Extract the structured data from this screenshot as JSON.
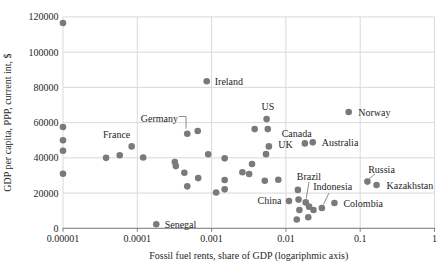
{
  "chart_data": {
    "type": "scatter",
    "title": "",
    "xlabel": "Fossil fuel rents, share of GDP (logariphmic axis)",
    "ylabel": "GDP per capita, PPP, current int, $",
    "x_scale": "log",
    "xlim": [
      1e-05,
      1
    ],
    "ylim": [
      0,
      120000
    ],
    "x_ticks": [
      1e-05,
      0.0001,
      0.001,
      0.01,
      0.1,
      1
    ],
    "x_tick_labels": [
      "0.00001",
      "0.0001",
      "0.001",
      "0.01",
      "0.1",
      "1"
    ],
    "y_ticks": [
      0,
      20000,
      40000,
      60000,
      80000,
      100000,
      120000
    ],
    "y_tick_labels": [
      "0",
      "20000",
      "40000",
      "60000",
      "80000",
      "100000",
      "120000"
    ],
    "grid": true,
    "legend": "none",
    "colors": {
      "marker": "#7a7a7a",
      "gridline": "#d9d9d9",
      "axis_line": "#808080",
      "leader_line": "#8c8c8c",
      "text": "#262626"
    },
    "points": [
      {
        "x": 1e-05,
        "y": 116500
      },
      {
        "x": 1e-05,
        "y": 57500
      },
      {
        "x": 1e-05,
        "y": 50000
      },
      {
        "x": 1e-05,
        "y": 44000
      },
      {
        "x": 1e-05,
        "y": 31000
      },
      {
        "x": 3.8e-05,
        "y": 40000
      },
      {
        "x": 5.8e-05,
        "y": 41500
      },
      {
        "x": 8.4e-05,
        "y": 46500,
        "label": "France",
        "dx": -15,
        "dy": -8.1,
        "anchor": "middle"
      },
      {
        "x": 0.00012,
        "y": 40200
      },
      {
        "x": 0.00018,
        "y": 2300,
        "label": "Senegal",
        "dx": 8.4,
        "dy": 3.8,
        "anchor": "start"
      },
      {
        "x": 0.00032,
        "y": 37600
      },
      {
        "x": 0.00033,
        "y": 35300
      },
      {
        "x": 0.00043,
        "y": 31500
      },
      {
        "x": 0.00047,
        "y": 53700,
        "label": "Germany",
        "dx": -9.2,
        "dy": -11.2,
        "anchor": "end",
        "leader": [
          [
            -8.2,
            -17.2
          ],
          [
            -1.2,
            -17.2
          ],
          [
            -1.2,
            -5.0
          ]
        ]
      },
      {
        "x": 0.00047,
        "y": 23800
      },
      {
        "x": 0.00065,
        "y": 55200
      },
      {
        "x": 0.00066,
        "y": 28500
      },
      {
        "x": 0.00086,
        "y": 83500,
        "label": "Ireland",
        "dx": 8,
        "dy": 3.5,
        "anchor": "start"
      },
      {
        "x": 0.0009,
        "y": 42000
      },
      {
        "x": 0.00115,
        "y": 20300
      },
      {
        "x": 0.0015,
        "y": 39700
      },
      {
        "x": 0.0015,
        "y": 27400
      },
      {
        "x": 0.0015,
        "y": 22100
      },
      {
        "x": 0.0026,
        "y": 31800
      },
      {
        "x": 0.0032,
        "y": 30800
      },
      {
        "x": 0.0035,
        "y": 36500
      },
      {
        "x": 0.0038,
        "y": 56300
      },
      {
        "x": 0.0055,
        "y": 62000,
        "label": "US",
        "dx": 1.4,
        "dy": -8.6,
        "anchor": "middle"
      },
      {
        "x": 0.0057,
        "y": 56300,
        "label": "Canada",
        "dx": 13.9,
        "dy": 7.9,
        "anchor": "start"
      },
      {
        "x": 0.0059,
        "y": 46500,
        "label": "UK",
        "dx": 9.4,
        "dy": 2.0,
        "anchor": "start"
      },
      {
        "x": 0.0054,
        "y": 42100
      },
      {
        "x": 0.0052,
        "y": 27000
      },
      {
        "x": 0.0079,
        "y": 27600
      },
      {
        "x": 0.011,
        "y": 15500,
        "label": "China",
        "dx": -7.5,
        "dy": 3.5,
        "anchor": "end"
      },
      {
        "x": 0.0145,
        "y": 21800
      },
      {
        "x": 0.0148,
        "y": 16300
      },
      {
        "x": 0.0152,
        "y": 10400
      },
      {
        "x": 0.014,
        "y": 5000
      },
      {
        "x": 0.0185,
        "y": 14700,
        "label": "Brazil",
        "dx": 3.2,
        "dy": -22.4,
        "anchor": "middle",
        "leader": [
          [
            3.2,
            -20.4
          ],
          [
            0.5,
            -4.0
          ]
        ]
      },
      {
        "x": 0.02,
        "y": 6300
      },
      {
        "x": 0.0205,
        "y": 12300
      },
      {
        "x": 0.023,
        "y": 48800,
        "label": "Australia",
        "dx": 8.9,
        "dy": 3.4,
        "anchor": "start"
      },
      {
        "x": 0.018,
        "y": 48200
      },
      {
        "x": 0.0235,
        "y": 10400
      },
      {
        "x": 0.0305,
        "y": 11500,
        "label": "Indonesia",
        "dx": -8.6,
        "dy": -18.0,
        "anchor": "start",
        "leader": [
          [
            7.1,
            -15.0
          ],
          [
            1.5,
            -3.5
          ]
        ]
      },
      {
        "x": 0.045,
        "y": 14400,
        "label": "Colombia",
        "dx": 9,
        "dy": 3.7,
        "anchor": "start"
      },
      {
        "x": 0.07,
        "y": 66000,
        "label": "Norway",
        "dx": 9.6,
        "dy": 3.8,
        "anchor": "start"
      },
      {
        "x": 0.125,
        "y": 26500,
        "label": "Russia",
        "dx": 14.1,
        "dy": -8.6,
        "anchor": "middle",
        "leader": [
          [
            7.6,
            -7.6
          ],
          [
            2.0,
            -3.0
          ]
        ]
      },
      {
        "x": 0.166,
        "y": 24600,
        "label": "Kazakhstan",
        "dx": 10,
        "dy": 4,
        "anchor": "start"
      }
    ]
  }
}
